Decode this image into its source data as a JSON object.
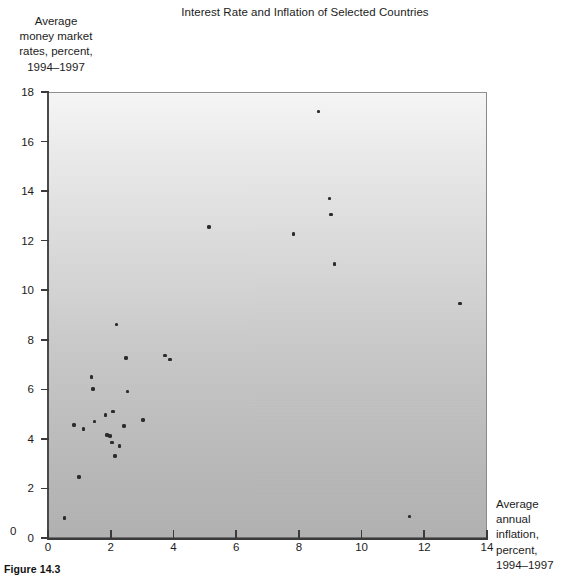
{
  "figure": {
    "caption": "Figure 14.3"
  },
  "chart_data": {
    "type": "scatter",
    "title": "Interest Rate and Inflation of Selected Countries",
    "xlabel": "Average annual inflation, percent, 1994–1997",
    "ylabel": "Average money market rates, percent, 1994–1997",
    "xlabel_lines": [
      "Average",
      "annual",
      "inflation,",
      "percent,",
      "1994–1997"
    ],
    "ylabel_lines": [
      "Average",
      "money market",
      "rates, percent,",
      "1994–1997"
    ],
    "xlim": [
      0,
      14
    ],
    "ylim": [
      0,
      18
    ],
    "xticks": [
      0,
      2,
      4,
      6,
      8,
      10,
      12,
      14
    ],
    "yticks": [
      0,
      2,
      4,
      6,
      8,
      10,
      12,
      14,
      16,
      18
    ],
    "xtick_labels": [
      "0",
      "2",
      "4",
      "6",
      "8",
      "10",
      "12",
      "14"
    ],
    "ytick_labels": [
      "0",
      "2",
      "4",
      "6",
      "8",
      "10",
      "12",
      "14",
      "16",
      "18"
    ],
    "grid": false,
    "legend": null,
    "marker": "filled-circle",
    "marker_color": "#2b2b2b",
    "plot_background": "vertical gradient, white at top to gray at bottom",
    "plot_background_top": "#f7f7f7",
    "plot_background_bottom": "#b2b2b2",
    "points": [
      {
        "x": 0.5,
        "y": 0.85
      },
      {
        "x": 0.95,
        "y": 2.5
      },
      {
        "x": 0.8,
        "y": 4.6
      },
      {
        "x": 1.1,
        "y": 4.45
      },
      {
        "x": 1.35,
        "y": 6.55
      },
      {
        "x": 1.4,
        "y": 6.05
      },
      {
        "x": 1.45,
        "y": 4.75
      },
      {
        "x": 1.8,
        "y": 5.0
      },
      {
        "x": 1.85,
        "y": 4.2
      },
      {
        "x": 1.95,
        "y": 4.15
      },
      {
        "x": 2.0,
        "y": 3.9
      },
      {
        "x": 2.05,
        "y": 5.15
      },
      {
        "x": 2.1,
        "y": 3.35
      },
      {
        "x": 2.15,
        "y": 8.65
      },
      {
        "x": 2.25,
        "y": 3.75
      },
      {
        "x": 2.4,
        "y": 4.55
      },
      {
        "x": 2.45,
        "y": 7.3
      },
      {
        "x": 2.5,
        "y": 5.95
      },
      {
        "x": 3.0,
        "y": 4.8
      },
      {
        "x": 3.7,
        "y": 7.4
      },
      {
        "x": 3.85,
        "y": 7.25
      },
      {
        "x": 5.1,
        "y": 12.6
      },
      {
        "x": 7.8,
        "y": 12.3
      },
      {
        "x": 8.6,
        "y": 17.25
      },
      {
        "x": 8.95,
        "y": 13.75
      },
      {
        "x": 9.0,
        "y": 13.1
      },
      {
        "x": 9.1,
        "y": 11.1
      },
      {
        "x": 11.5,
        "y": 0.9
      },
      {
        "x": 13.1,
        "y": 9.5
      }
    ]
  }
}
